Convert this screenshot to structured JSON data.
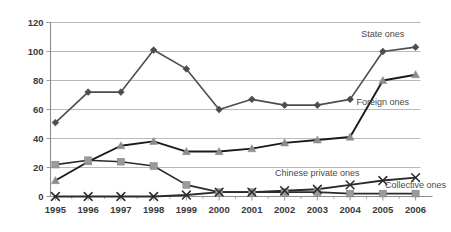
{
  "chart_data": {
    "type": "line",
    "title": "",
    "subtitle": "",
    "xlabel": "",
    "ylabel": "",
    "ylim": [
      0,
      120
    ],
    "ytick_step": 20,
    "yticks": [
      "0",
      "20",
      "40",
      "60",
      "80",
      "100",
      "120"
    ],
    "grid": true,
    "legend_position": "inline-annotations",
    "categories": [
      "1995",
      "1996",
      "1997",
      "1998",
      "1999",
      "2000",
      "2001",
      "2002",
      "2003",
      "2004",
      "2005",
      "2006"
    ],
    "series": [
      {
        "name": "State ones",
        "label": "State ones",
        "marker": "diamond",
        "color": "#4d4d4d",
        "line_color": "#4d4d4d",
        "values": [
          51,
          72,
          72,
          101,
          88,
          60,
          67,
          63,
          63,
          67,
          100,
          103
        ]
      },
      {
        "name": "Foreign ones",
        "label": "Foreign ones",
        "marker": "triangle",
        "color": "#8c8c8c",
        "line_color": "#1a1a1a",
        "values": [
          11,
          24,
          35,
          38,
          31,
          31,
          33,
          37,
          39,
          41,
          80,
          84
        ]
      },
      {
        "name": "Collective ones",
        "label": "Collective ones",
        "marker": "square",
        "color": "#9a9a9a",
        "line_color": "#2b2b2b",
        "values": [
          22,
          25,
          24,
          21,
          8,
          3,
          3,
          3,
          3,
          2,
          2,
          2
        ]
      },
      {
        "name": "Chinese private ones",
        "label": "Chinese private ones",
        "marker": "cross",
        "color": "#2b2b2b",
        "line_color": "#2b2b2b",
        "values": [
          0,
          0,
          0,
          0,
          1,
          3,
          3,
          4,
          5,
          8,
          11,
          13
        ]
      }
    ],
    "annotations": [
      {
        "text": "State ones",
        "anchor_x": 2005,
        "anchor_y": 110
      },
      {
        "text": "Foreign ones",
        "anchor_x": 2005,
        "anchor_y": 63
      },
      {
        "text": "Chinese private ones",
        "anchor_x": 2003,
        "anchor_y": 14
      },
      {
        "text": "Collective ones",
        "anchor_x": 2006,
        "anchor_y": 6
      }
    ]
  },
  "colors": {
    "background": "#ffffff",
    "gridline": "#a8a8a8",
    "axis": "#8d8d8d",
    "text": "#3a3a3a",
    "state": "#4d4d4d",
    "foreign": "#8c8c8c",
    "collective": "#9a9a9a",
    "private": "#2b2b2b"
  }
}
